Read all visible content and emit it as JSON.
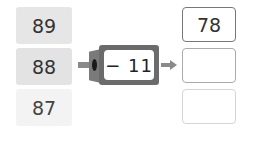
{
  "inputs": [
    "89",
    "88",
    "87"
  ],
  "machine": {
    "operation": "− 11"
  },
  "outputs": [
    "78",
    "",
    ""
  ],
  "colors": {
    "machine": "#6b6b6b",
    "arrow": "#8a8a8a",
    "input_cell": "#e6e6e6"
  }
}
